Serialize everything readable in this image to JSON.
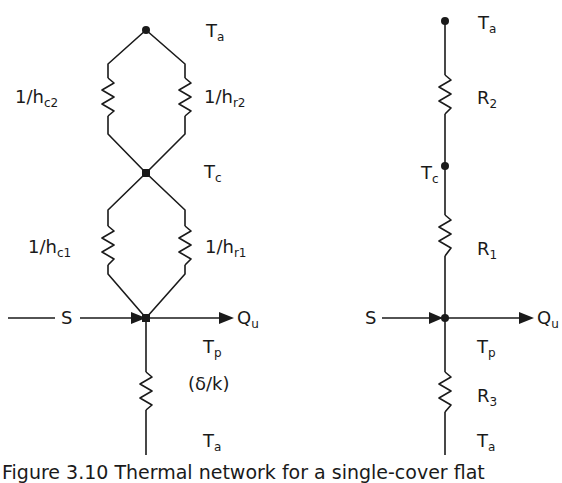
{
  "colors": {
    "line": "#1a1a1a",
    "background": "#ffffff"
  },
  "left_network": {
    "nodes": {
      "top": {
        "label": "T",
        "sub": "a"
      },
      "cover": {
        "label": "T",
        "sub": "c"
      },
      "plate": {
        "label": "T",
        "sub": "p"
      },
      "bottom": {
        "label": "T",
        "sub": "a"
      }
    },
    "resistors": {
      "conv_top": {
        "label": "1/h",
        "sub": "c2"
      },
      "rad_top": {
        "label": "1/h",
        "sub": "r2"
      },
      "conv_bottom": {
        "label": "1/h",
        "sub": "c1"
      },
      "rad_bottom": {
        "label": "1/h",
        "sub": "r1"
      },
      "back": {
        "label": "(δ/k)"
      }
    },
    "input": {
      "label": "S"
    },
    "output": {
      "label": "Q",
      "sub": "u"
    }
  },
  "right_network": {
    "nodes": {
      "top": {
        "label": "T",
        "sub": "a"
      },
      "cover": {
        "label": "T",
        "sub": "c"
      },
      "plate": {
        "label": "T",
        "sub": "p"
      },
      "bottom": {
        "label": "T",
        "sub": "a"
      }
    },
    "resistors": {
      "r2": {
        "label": "R",
        "sub": "2"
      },
      "r1": {
        "label": "R",
        "sub": "1"
      },
      "r3": {
        "label": "R",
        "sub": "3"
      }
    },
    "input": {
      "label": "S"
    },
    "output": {
      "label": "Q",
      "sub": "u"
    }
  },
  "caption": {
    "text": "Figure 3.10 Thermal network for a single-cover flat"
  }
}
